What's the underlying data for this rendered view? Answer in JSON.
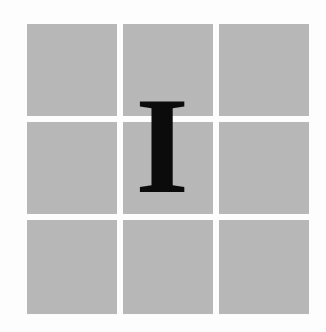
{
  "drop_cap": {
    "letter": "I",
    "color": "#0b0b0b"
  },
  "grid": {
    "rows": 3,
    "columns": 3,
    "cell_color": "#bdbdbd",
    "cells": [
      {
        "row": 1,
        "col": 1
      },
      {
        "row": 1,
        "col": 2
      },
      {
        "row": 1,
        "col": 3
      },
      {
        "row": 2,
        "col": 1
      },
      {
        "row": 2,
        "col": 2
      },
      {
        "row": 2,
        "col": 3
      },
      {
        "row": 3,
        "col": 1
      },
      {
        "row": 3,
        "col": 2
      },
      {
        "row": 3,
        "col": 3
      }
    ]
  }
}
